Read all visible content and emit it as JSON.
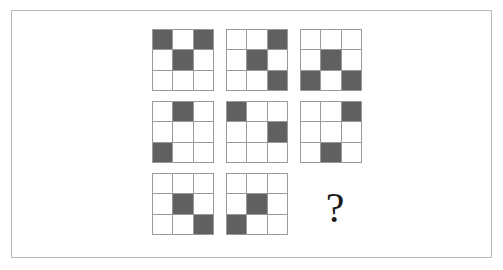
{
  "puzzle": {
    "type": "matrix-reasoning-3x3",
    "missing_label": "?",
    "colors": {
      "filled_cell": "#606060",
      "empty_cell": "#ffffff",
      "grid_line": "#9a9a9a",
      "frame_border": "#b9b9b9",
      "background": "#ffffff",
      "question_mark": "#1a1a1a"
    },
    "cells": [
      {
        "position": "row1-col1",
        "name": "pattern-1",
        "filled": [
          true,
          false,
          true,
          false,
          true,
          false,
          false,
          false,
          false
        ]
      },
      {
        "position": "row1-col2",
        "name": "pattern-2",
        "filled": [
          false,
          false,
          true,
          false,
          true,
          false,
          false,
          false,
          true
        ]
      },
      {
        "position": "row1-col3",
        "name": "pattern-3",
        "filled": [
          false,
          false,
          false,
          false,
          true,
          false,
          true,
          false,
          true
        ]
      },
      {
        "position": "row2-col1",
        "name": "pattern-4",
        "filled": [
          false,
          true,
          false,
          false,
          false,
          false,
          true,
          false,
          false
        ]
      },
      {
        "position": "row2-col2",
        "name": "pattern-5",
        "filled": [
          true,
          false,
          false,
          false,
          false,
          true,
          false,
          false,
          false
        ]
      },
      {
        "position": "row2-col3",
        "name": "pattern-6",
        "filled": [
          false,
          false,
          true,
          false,
          false,
          false,
          false,
          true,
          false
        ]
      },
      {
        "position": "row3-col1",
        "name": "pattern-7",
        "filled": [
          false,
          false,
          false,
          false,
          true,
          false,
          false,
          false,
          true
        ]
      },
      {
        "position": "row3-col2",
        "name": "pattern-8",
        "filled": [
          false,
          false,
          false,
          false,
          true,
          false,
          true,
          false,
          false
        ]
      },
      {
        "position": "row3-col3",
        "name": "answer-placeholder",
        "filled": null
      }
    ]
  }
}
